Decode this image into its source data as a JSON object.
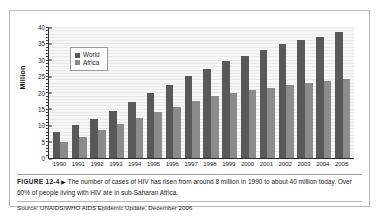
{
  "figure": {
    "label": "FIGURE 12-4",
    "arrow": "▶",
    "caption": "The number of cases of HIV has risen from around 8 million in 1990 to about 40 million today. Over 60% of people living with HIV are in sub-Saharan Africa.",
    "source": "Source: UNAIDS/WHO AIDS Epidemic Update, December 2006"
  },
  "colors": {
    "world": "#595959",
    "africa": "#8b8b8b",
    "axis": "#2b2b2b",
    "frame": "#b9b9b9",
    "plot_background": "#f2f2f2"
  },
  "chart_data": {
    "type": "bar",
    "title": "",
    "xlabel": "",
    "ylabel": "Million",
    "ylim": [
      0,
      40
    ],
    "yticks": [
      0,
      5,
      10,
      15,
      20,
      25,
      30,
      35,
      40
    ],
    "grid": true,
    "legend_position": "top-left-inset",
    "categories": [
      "1990",
      "1991",
      "1992",
      "1993",
      "1994",
      "1995",
      "1996",
      "1997",
      "1998",
      "1999",
      "2000",
      "2001",
      "2002",
      "2003",
      "2004",
      "2005"
    ],
    "series": [
      {
        "name": "World",
        "color": "#595959",
        "values": [
          8,
          10,
          12,
          14.5,
          17,
          20,
          22.3,
          25,
          27.2,
          29.7,
          31.3,
          33,
          34.7,
          36,
          37,
          38.5
        ]
      },
      {
        "name": "Africa",
        "color": "#8b8b8b",
        "values": [
          5,
          6.5,
          8.5,
          10.3,
          12.2,
          14,
          15.5,
          17.3,
          19,
          20,
          20.8,
          21.5,
          22.3,
          23,
          23.6,
          24.2
        ]
      }
    ]
  }
}
